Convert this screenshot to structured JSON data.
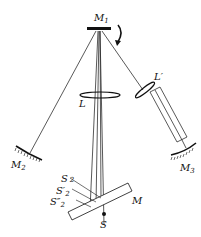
{
  "diagram": {
    "labels": {
      "m1": "M",
      "m1_sub": "1",
      "m2": "M",
      "m2_sub": "2",
      "m3": "M",
      "m3_sub": "3",
      "lens_l": "L",
      "lens_lprime": "L′",
      "mirror_m": "M",
      "source": "S",
      "s2": "S",
      "s2_sub": "2",
      "s2p": "S′",
      "s2p_sub": "2",
      "s2pp": "S″",
      "s2pp_sub": "2"
    },
    "colors": {
      "line": "#111111",
      "background": "#ffffff"
    }
  }
}
